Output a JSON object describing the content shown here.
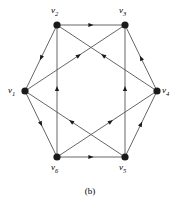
{
  "figure": {
    "caption": "(b)",
    "caption_y": 186,
    "background": "#ffffff",
    "ink_color": "#1a1a1a",
    "edge_color": "#555555",
    "width": 180,
    "height": 202
  },
  "graph": {
    "type": "directed-graph",
    "description": "Directed hexagonal graph with six labelled vertices and twelve directed edges",
    "vertex_radius": 3.6,
    "vertices": [
      {
        "id": "v1",
        "label": "v",
        "subscript": "1",
        "x": 25,
        "y": 91,
        "label_x": 8,
        "label_y": 86
      },
      {
        "id": "v2",
        "label": "v",
        "subscript": "2",
        "x": 57,
        "y": 25,
        "label_x": 51,
        "label_y": 6
      },
      {
        "id": "v3",
        "label": "v",
        "subscript": "3",
        "x": 125,
        "y": 25,
        "label_x": 119,
        "label_y": 6
      },
      {
        "id": "v4",
        "label": "v",
        "subscript": "4",
        "x": 157,
        "y": 91,
        "label_x": 162,
        "label_y": 86
      },
      {
        "id": "v5",
        "label": "v",
        "subscript": "5",
        "x": 125,
        "y": 157,
        "label_x": 119,
        "label_y": 163
      },
      {
        "id": "v6",
        "label": "v",
        "subscript": "6",
        "x": 57,
        "y": 157,
        "label_x": 51,
        "label_y": 163
      }
    ],
    "edges": [
      {
        "from": "v2",
        "to": "v3",
        "arrow_t": 0.5,
        "name": "edge-v2-v3"
      },
      {
        "from": "v2",
        "to": "v1",
        "arrow_t": 0.5,
        "name": "edge-v2-v1"
      },
      {
        "from": "v1",
        "to": "v6",
        "arrow_t": 0.5,
        "name": "edge-v1-v6"
      },
      {
        "from": "v6",
        "to": "v5",
        "arrow_t": 0.5,
        "name": "edge-v6-v5"
      },
      {
        "from": "v5",
        "to": "v4",
        "arrow_t": 0.5,
        "name": "edge-v5-v4"
      },
      {
        "from": "v4",
        "to": "v3",
        "arrow_t": 0.5,
        "name": "edge-v4-v3"
      },
      {
        "from": "v6",
        "to": "v2",
        "arrow_t": 0.52,
        "name": "edge-v6-v2"
      },
      {
        "from": "v5",
        "to": "v3",
        "arrow_t": 0.52,
        "name": "edge-v5-v3"
      },
      {
        "from": "v1",
        "to": "v3",
        "arrow_t": 0.54,
        "name": "edge-v1-v3"
      },
      {
        "from": "v4",
        "to": "v2",
        "arrow_t": 0.54,
        "name": "edge-v4-v2"
      },
      {
        "from": "v5",
        "to": "v1",
        "arrow_t": 0.54,
        "name": "edge-v5-v1"
      },
      {
        "from": "v6",
        "to": "v4",
        "arrow_t": 0.54,
        "name": "edge-v6-v4"
      }
    ]
  }
}
